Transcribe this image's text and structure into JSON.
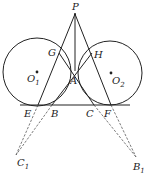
{
  "diagram": {
    "type": "geometry",
    "points": {
      "P": {
        "label": "P",
        "x": 75,
        "y": 14
      },
      "A": {
        "label": "A",
        "x": 75,
        "y": 71
      },
      "G": {
        "label": "G",
        "x": 59,
        "y": 53
      },
      "H": {
        "label": "H",
        "x": 92,
        "y": 53
      },
      "E": {
        "label": "E",
        "x": 38,
        "y": 105
      },
      "B": {
        "label": "B",
        "x": 52,
        "y": 105
      },
      "C": {
        "label": "C",
        "x": 94,
        "y": 105
      },
      "F": {
        "label": "F",
        "x": 111,
        "y": 105
      },
      "O1": {
        "label": "O",
        "sub": "1",
        "x": 37,
        "y": 72
      },
      "O2": {
        "label": "O",
        "sub": "2",
        "x": 111,
        "y": 73
      },
      "C1": {
        "label": "C",
        "sub": "1",
        "x": 16,
        "y": 155
      },
      "B1": {
        "label": "B",
        "sub": "1",
        "x": 136,
        "y": 157
      }
    },
    "circles": [
      {
        "name": "circle-O1",
        "cx": 37,
        "cy": 72,
        "r": 34
      },
      {
        "name": "circle-O2",
        "cx": 110,
        "cy": 73,
        "r": 32
      }
    ],
    "solid_segments": [
      [
        "P",
        "E"
      ],
      [
        "P",
        "F"
      ],
      [
        "P",
        "A"
      ],
      [
        "B",
        "H"
      ],
      [
        "C",
        "G"
      ]
    ],
    "dashed_segments": [
      [
        "E",
        "C1"
      ],
      [
        "B",
        "C1"
      ],
      [
        "C",
        "B1"
      ],
      [
        "F",
        "B1"
      ]
    ],
    "baseline": {
      "x1": 20,
      "x2": 130,
      "y": 105
    },
    "stroke_color": "#222222"
  }
}
